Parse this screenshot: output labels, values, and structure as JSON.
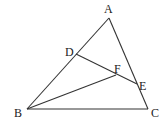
{
  "diagram": {
    "type": "geometry",
    "points": {
      "A": {
        "label": "A",
        "x": 109,
        "y": 18,
        "lx": 104,
        "ly": 13
      },
      "B": {
        "label": "B",
        "x": 27,
        "y": 109,
        "lx": 14,
        "ly": 117
      },
      "C": {
        "label": "C",
        "x": 148,
        "y": 109,
        "lx": 151,
        "ly": 117
      },
      "D": {
        "label": "D",
        "x": 76,
        "y": 54,
        "lx": 65,
        "ly": 56
      },
      "E": {
        "label": "E",
        "x": 137,
        "y": 84,
        "lx": 139,
        "ly": 90
      },
      "F": {
        "label": "F",
        "x": 116,
        "y": 75,
        "lx": 114,
        "ly": 73
      }
    },
    "segments": [
      [
        "A",
        "B"
      ],
      [
        "A",
        "C"
      ],
      [
        "B",
        "C"
      ],
      [
        "D",
        "E"
      ],
      [
        "B",
        "F"
      ]
    ],
    "line_color": "#333333"
  }
}
